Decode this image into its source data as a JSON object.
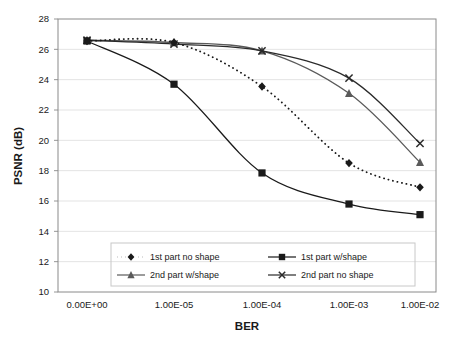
{
  "chart_data": {
    "type": "line",
    "title": "",
    "xlabel": "BER",
    "ylabel": "PSNR (dB)",
    "x": [
      0,
      1e-05,
      0.0001,
      0.001,
      0.01
    ],
    "xticklabels": [
      "0.00E+00",
      "1.00E-05",
      "1.00E-04",
      "1.00E-03",
      "1.00E-02"
    ],
    "yticklabels": [
      "10",
      "12",
      "14",
      "16",
      "18",
      "20",
      "22",
      "24",
      "26",
      "28"
    ],
    "yticks": [
      10,
      12,
      14,
      16,
      18,
      20,
      22,
      24,
      26,
      28
    ],
    "ylim": [
      10,
      28
    ],
    "grid": true,
    "grid_axis": "y",
    "legend_position": "inside-bottom",
    "series": [
      {
        "name": "1st part no shape",
        "marker": "diamond",
        "linestyle": "dotted",
        "color": "#1a1a1a",
        "values": [
          26.55,
          26.45,
          23.55,
          18.5,
          16.9
        ]
      },
      {
        "name": "1st part w/shape",
        "marker": "square",
        "linestyle": "solid",
        "color": "#1a1a1a",
        "values": [
          26.55,
          23.7,
          17.85,
          15.8,
          15.1
        ]
      },
      {
        "name": "2nd part w/shape",
        "marker": "triangle",
        "linestyle": "solid",
        "color": "#5a5a5a",
        "values": [
          26.6,
          26.45,
          25.9,
          23.1,
          18.55
        ]
      },
      {
        "name": "2nd part no shape",
        "marker": "cross",
        "linestyle": "solid",
        "color": "#2a2a2a",
        "values": [
          26.6,
          26.35,
          25.9,
          24.1,
          19.8
        ]
      }
    ]
  },
  "axes": {
    "xlabel": "BER",
    "ylabel": "PSNR (dB)"
  },
  "legend": {
    "entries": [
      {
        "label": "1st part no shape"
      },
      {
        "label": "1st part w/shape"
      },
      {
        "label": "2nd part w/shape"
      },
      {
        "label": "2nd part no shape"
      }
    ]
  },
  "colors": {
    "plot_border": "#8a8a8a",
    "gridline": "#dcdcdc",
    "legend_border": "#c8c8c8",
    "ink": "#1a1a1a",
    "gray_series": "#5a5a5a",
    "background": "#ffffff"
  }
}
